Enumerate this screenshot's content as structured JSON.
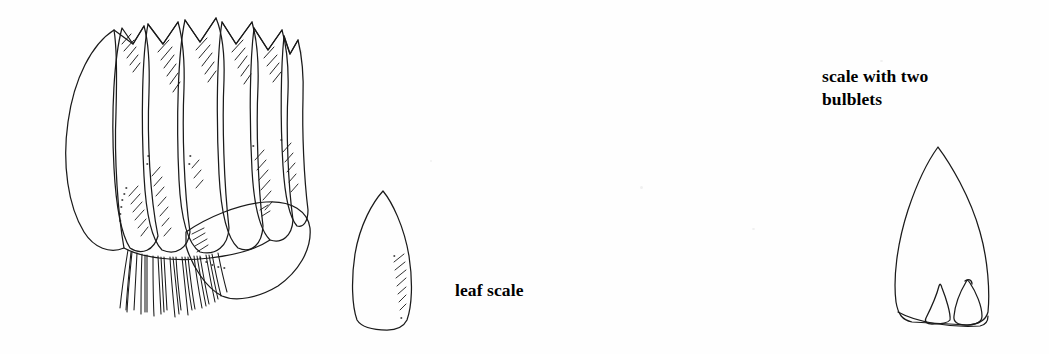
{
  "page": {
    "width": 1049,
    "height": 354,
    "background_color": "#fefefe",
    "ink_color": "#1a1a1a",
    "text_color": "#000000",
    "kind": "botanical-line-illustration"
  },
  "labels": {
    "leaf_scale": "leaf scale",
    "scale_with_two_bulblets_line1": "scale with two",
    "scale_with_two_bulblets_line2": "bulblets"
  },
  "figures": [
    {
      "name": "bulb-cluster",
      "description": "whole bulb made of many overlapping pointed scales with fibrous roots at base and one detached outer scale angled to the right",
      "bbox": [
        60,
        18,
        300,
        300
      ],
      "parts": [
        "outer-scale-left",
        "inner-scales",
        "scale-tips-hatching",
        "detached-outer-scale",
        "root-fibers"
      ]
    },
    {
      "name": "leaf-scale",
      "description": "single detached elongate pointed leaf scale with hatching on lower right margin",
      "bbox": [
        352,
        190,
        62,
        140
      ]
    },
    {
      "name": "scale-with-two-bulblets",
      "description": "large pointed scale with two small teardrop bulblets attached at its base",
      "bbox": [
        893,
        146,
        108,
        182
      ],
      "bulblet_count": 2
    }
  ]
}
